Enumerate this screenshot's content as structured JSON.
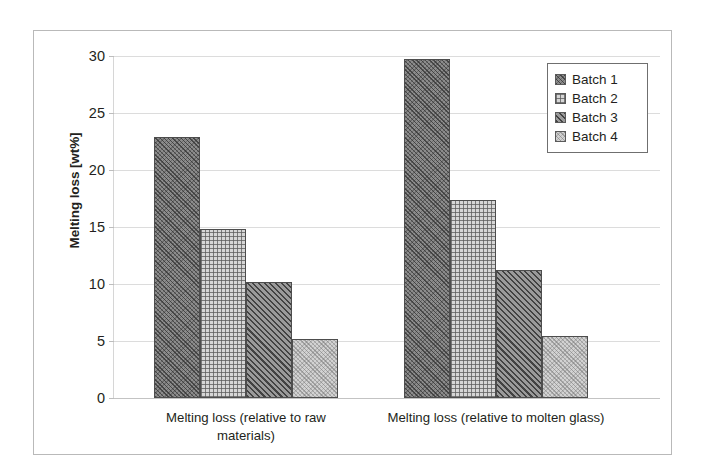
{
  "chart_data": {
    "type": "bar",
    "title": "",
    "xlabel": "",
    "ylabel": "Melting loss [wt%]",
    "ylim": [
      0,
      30
    ],
    "yticks": [
      0,
      5,
      10,
      15,
      20,
      25,
      30
    ],
    "ytick_labels": [
      "0",
      "5",
      "10",
      "15",
      "20",
      "25",
      "30"
    ],
    "grid": true,
    "legend_position": "top-right",
    "categories": [
      "Melting loss (relative to raw materials)",
      "Melting loss (relative to molten glass)"
    ],
    "category_lines": [
      [
        "Melting loss (relative to raw",
        "materials)"
      ],
      [
        "Melting loss (relative to molten glass)"
      ]
    ],
    "series": [
      {
        "name": "Batch 1",
        "values": [
          22.9,
          29.7
        ],
        "pattern": "dark-diagonal-hatch",
        "color": "#8c8c8c"
      },
      {
        "name": "Batch 2",
        "values": [
          14.8,
          17.4
        ],
        "pattern": "light-grid",
        "color": "#d6d6d6"
      },
      {
        "name": "Batch 3",
        "values": [
          10.2,
          11.2
        ],
        "pattern": "medium-diagonal-hatch",
        "color": "#9a9a9a"
      },
      {
        "name": "Batch 4",
        "values": [
          5.2,
          5.4
        ],
        "pattern": "light-speckle",
        "color": "#d2d2d2"
      }
    ]
  },
  "legend": {
    "entries": [
      {
        "label": "Batch 1"
      },
      {
        "label": "Batch 2"
      },
      {
        "label": "Batch 3"
      },
      {
        "label": "Batch 4"
      }
    ]
  },
  "style": {
    "frame_color": "#b9b9b9",
    "gridline_color": "#dcdcdc",
    "text_color": "#231f20",
    "bar_border_color": "#4d4d4d"
  }
}
